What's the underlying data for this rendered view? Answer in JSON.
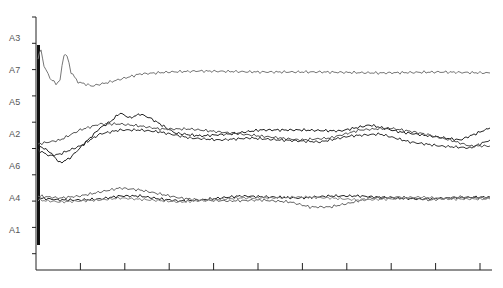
{
  "chart_data": {
    "type": "line",
    "title": "",
    "xlabel": "",
    "ylabel": "",
    "grid": false,
    "legend": "none",
    "x_ticks": 10,
    "x_tick_labels": [],
    "y_row_labels": [
      "A3",
      "A7",
      "A5",
      "A2",
      "A6",
      "A4",
      "A1"
    ],
    "series": [
      {
        "name": "A7 trace (upper)",
        "color": "#777777",
        "points": [
          [
            38,
            58
          ],
          [
            41,
            50
          ],
          [
            44,
            66
          ],
          [
            50,
            78
          ],
          [
            56,
            84
          ],
          [
            60,
            80
          ],
          [
            64,
            54
          ],
          [
            67,
            56
          ],
          [
            71,
            72
          ],
          [
            78,
            82
          ],
          [
            92,
            86
          ],
          [
            110,
            82
          ],
          [
            140,
            74
          ],
          [
            170,
            72
          ],
          [
            200,
            71
          ],
          [
            260,
            72
          ],
          [
            320,
            72
          ],
          [
            380,
            73
          ],
          [
            440,
            72
          ],
          [
            490,
            73
          ]
        ]
      },
      {
        "name": "A2 trace 1",
        "color": "#222222",
        "points": [
          [
            38,
            145
          ],
          [
            50,
            152
          ],
          [
            60,
            163
          ],
          [
            70,
            158
          ],
          [
            80,
            148
          ],
          [
            90,
            138
          ],
          [
            100,
            128
          ],
          [
            110,
            122
          ],
          [
            120,
            113
          ],
          [
            130,
            118
          ],
          [
            140,
            114
          ],
          [
            150,
            118
          ],
          [
            160,
            124
          ],
          [
            175,
            133
          ],
          [
            200,
            136
          ],
          [
            230,
            134
          ],
          [
            260,
            130
          ],
          [
            300,
            130
          ],
          [
            340,
            131
          ],
          [
            370,
            125
          ],
          [
            400,
            132
          ],
          [
            430,
            136
          ],
          [
            460,
            140
          ],
          [
            490,
            128
          ]
        ]
      },
      {
        "name": "A2 trace 2",
        "color": "#555555",
        "points": [
          [
            38,
            144
          ],
          [
            60,
            140
          ],
          [
            80,
            130
          ],
          [
            100,
            124
          ],
          [
            120,
            124
          ],
          [
            140,
            126
          ],
          [
            160,
            129
          ],
          [
            190,
            129
          ],
          [
            220,
            132
          ],
          [
            260,
            136
          ],
          [
            300,
            140
          ],
          [
            330,
            138
          ],
          [
            360,
            130
          ],
          [
            390,
            128
          ],
          [
            420,
            133
          ],
          [
            450,
            140
          ],
          [
            470,
            146
          ],
          [
            490,
            146
          ]
        ]
      },
      {
        "name": "A6 trace",
        "color": "#333333",
        "points": [
          [
            38,
            150
          ],
          [
            50,
            156
          ],
          [
            60,
            154
          ],
          [
            70,
            150
          ],
          [
            80,
            146
          ],
          [
            100,
            134
          ],
          [
            120,
            130
          ],
          [
            140,
            130
          ],
          [
            160,
            132
          ],
          [
            190,
            138
          ],
          [
            220,
            140
          ],
          [
            250,
            138
          ],
          [
            280,
            140
          ],
          [
            320,
            142
          ],
          [
            350,
            136
          ],
          [
            380,
            134
          ],
          [
            410,
            142
          ],
          [
            440,
            146
          ],
          [
            470,
            148
          ],
          [
            490,
            140
          ]
        ]
      },
      {
        "name": "A4 trace 1",
        "color": "#222222",
        "points": [
          [
            38,
            198
          ],
          [
            60,
            200
          ],
          [
            80,
            200
          ],
          [
            100,
            199
          ],
          [
            120,
            196
          ],
          [
            140,
            196
          ],
          [
            160,
            199
          ],
          [
            180,
            201
          ],
          [
            200,
            200
          ],
          [
            240,
            196
          ],
          [
            270,
            197
          ],
          [
            300,
            198
          ],
          [
            330,
            196
          ],
          [
            360,
            196
          ],
          [
            390,
            198
          ],
          [
            420,
            199
          ],
          [
            450,
            198
          ],
          [
            490,
            197
          ]
        ]
      },
      {
        "name": "A4 trace 2",
        "color": "#666666",
        "points": [
          [
            38,
            196
          ],
          [
            60,
            198
          ],
          [
            80,
            196
          ],
          [
            100,
            192
          ],
          [
            120,
            188
          ],
          [
            140,
            190
          ],
          [
            160,
            194
          ],
          [
            180,
            198
          ],
          [
            200,
            200
          ],
          [
            230,
            201
          ],
          [
            260,
            200
          ],
          [
            290,
            202
          ],
          [
            310,
            207
          ],
          [
            330,
            207
          ],
          [
            350,
            203
          ],
          [
            370,
            198
          ],
          [
            400,
            197
          ],
          [
            430,
            200
          ],
          [
            460,
            197
          ],
          [
            490,
            198
          ]
        ]
      },
      {
        "name": "A4 trace 3",
        "color": "#888888",
        "points": [
          [
            38,
            200
          ],
          [
            60,
            202
          ],
          [
            80,
            201
          ],
          [
            100,
            200
          ],
          [
            120,
            198
          ],
          [
            150,
            200
          ],
          [
            180,
            202
          ],
          [
            210,
            200
          ],
          [
            240,
            198
          ],
          [
            270,
            198
          ],
          [
            300,
            197
          ],
          [
            330,
            198
          ],
          [
            360,
            200
          ],
          [
            390,
            199
          ],
          [
            420,
            197
          ],
          [
            450,
            199
          ],
          [
            490,
            199
          ]
        ]
      }
    ],
    "axis": {
      "x_origin": 36,
      "x_end": 492,
      "y_axis_x": 36,
      "y_top": 17,
      "y_bottom": 270
    }
  }
}
